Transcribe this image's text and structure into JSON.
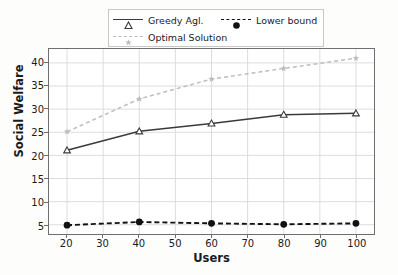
{
  "chart_data": {
    "type": "line",
    "title": "",
    "xlabel": "Users",
    "ylabel": "Social Welfare",
    "x": [
      20,
      40,
      60,
      80,
      100
    ],
    "xlim": [
      15,
      105
    ],
    "ylim": [
      3,
      43
    ],
    "xticks": [
      20,
      30,
      40,
      50,
      60,
      70,
      80,
      90,
      100
    ],
    "yticks": [
      5,
      10,
      15,
      20,
      25,
      30,
      35,
      40
    ],
    "grid": true,
    "legend_position": "upper center",
    "series": [
      {
        "name": "Greedy Agl.",
        "values": [
          21.1,
          25.2,
          26.9,
          28.8,
          29.1
        ],
        "color": "#3a3a3a",
        "linestyle": "solid",
        "marker": "triangle-open"
      },
      {
        "name": "Optimal Solution",
        "values": [
          25.1,
          32.2,
          36.5,
          38.8,
          41.0
        ],
        "color": "#bdbdbd",
        "linestyle": "dashed",
        "marker": "star"
      },
      {
        "name": "Lower bound",
        "values": [
          4.9,
          5.6,
          5.3,
          5.1,
          5.3
        ],
        "color": "#111111",
        "linestyle": "dashed",
        "marker": "circle-filled"
      }
    ]
  },
  "legend": {
    "entries": [
      {
        "label": "Greedy Agl."
      },
      {
        "label": "Lower bound"
      },
      {
        "label": "Optimal Solution"
      }
    ]
  },
  "axes": {
    "x_title": "Users",
    "y_title": "Social Welfare",
    "x_tick_labels": [
      "20",
      "30",
      "40",
      "50",
      "60",
      "70",
      "80",
      "90",
      "100"
    ],
    "y_tick_labels": [
      "5",
      "10",
      "15",
      "20",
      "25",
      "30",
      "35",
      "40"
    ]
  },
  "colors": {
    "grid": "#d9d9d9",
    "frame": "#6e6e6e",
    "greedy": "#3a3a3a",
    "optimal": "#bdbdbd",
    "lower": "#111111",
    "background": "#fdfdfc"
  }
}
